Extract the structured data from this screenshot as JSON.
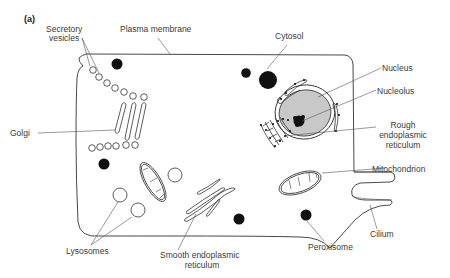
{
  "figure": {
    "panel_label": "(a)"
  },
  "labels": {
    "secretory_vesicles_1": "Secretory",
    "secretory_vesicles_2": "vesicles",
    "plasma_membrane": "Plasma membrane",
    "cytosol": "Cytosol",
    "nucleus": "Nucleus",
    "nucleolus": "Nucleolus",
    "golgi": "Golgi",
    "rough_er_1": "Rough",
    "rough_er_2": "endoplasmic",
    "rough_er_3": "reticulum",
    "mitochondrion": "Mitochondrion",
    "cilium": "Cilium",
    "lysosomes": "Lysosomes",
    "smooth_er_1": "Smooth endoplasmic",
    "smooth_er_2": "reticulum",
    "peroxisome": "Peroxisome"
  },
  "colors": {
    "outline": "#333333",
    "nucleus_fill": "#c8c8c8",
    "organelle_dark": "#111111",
    "label_text": "#3a3a3a"
  }
}
